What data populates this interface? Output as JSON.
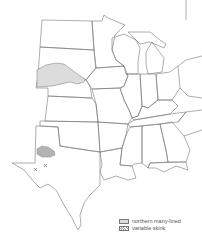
{
  "map": {
    "region": "Central United States",
    "ranges": [
      {
        "name": "northern many-lined",
        "fill": "#dddddd",
        "location": "western Nebraska / southern South Dakota"
      },
      {
        "name": "variable skink",
        "fill": "hatched",
        "location": "Texas panhandle south plains"
      }
    ],
    "markers": [
      {
        "symbol": "x",
        "label": "variable skink occurrence",
        "x": 35,
        "y": 169
      },
      {
        "symbol": "x",
        "label": "variable skink occurrence",
        "x": 45,
        "y": 165
      }
    ]
  },
  "legend": {
    "items": [
      {
        "label": "northern many-lined",
        "swatch": "solid"
      },
      {
        "label": "variable skink",
        "swatch": "hatch"
      }
    ]
  }
}
